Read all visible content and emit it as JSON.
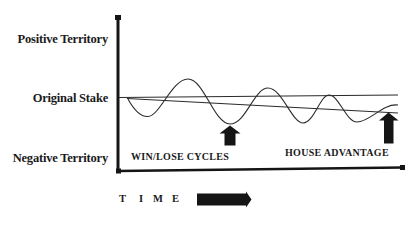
{
  "diagram": {
    "title": "",
    "y_axis_labels": {
      "positive": "Positive Territory",
      "original": "Original Stake",
      "negative": "Negative Territory"
    },
    "annotations": {
      "win_lose": "WIN/LOSE CYCLES",
      "house_advantage": "HOUSE ADVANTAGE"
    },
    "time_axis": {
      "letters": [
        "T",
        "I",
        "M",
        "E"
      ],
      "label": "TIME",
      "arrow": "right-arrow"
    },
    "colors": {
      "ink": "#151515",
      "line": "#2a2a2a",
      "background": "#ffffff"
    },
    "series": [
      {
        "name": "original-stake-line",
        "shape": "flat horizontal line"
      },
      {
        "name": "house-advantage-trend",
        "shape": "slowly declining straight line"
      },
      {
        "name": "win-lose-cycles",
        "shape": "sine wave oscillating around declining trend"
      }
    ],
    "markers": [
      {
        "name": "win-lose-arrow",
        "points_to": "trough of oscillation"
      },
      {
        "name": "house-advantage-arrow",
        "points_to": "declining trend line"
      }
    ]
  }
}
